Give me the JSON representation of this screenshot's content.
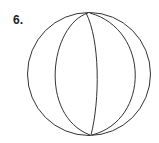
{
  "figure": {
    "label": "6.",
    "stroke_color": "#333333"
  }
}
